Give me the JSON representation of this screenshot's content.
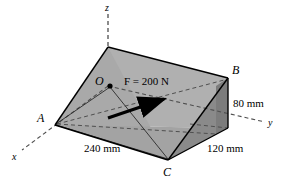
{
  "figure": {
    "type": "engineering-statics-diagram",
    "background_color": "#ffffff",
    "face_colors": {
      "top_light": "#b4b4b4",
      "left_front": "#a8a8a8",
      "front_right": "#9a9a9a",
      "end_dark": "#7d7d7d",
      "outline": "#000000",
      "dashed": "#555555"
    }
  },
  "axes": [
    {
      "name": "z",
      "label": "z",
      "label_x": 107,
      "label_y": 4
    },
    {
      "name": "y",
      "label": "y",
      "label_x": 268,
      "label_y": 120
    },
    {
      "name": "x",
      "label": "x",
      "label_x": 13,
      "label_y": 154
    }
  ],
  "points": [
    {
      "name": "O",
      "label": "O",
      "label_x": 95,
      "label_y": 77,
      "dot_x": 110,
      "dot_y": 86
    },
    {
      "name": "A",
      "label": "A",
      "label_x": 37,
      "label_y": 113
    },
    {
      "name": "B",
      "label": "B",
      "label_x": 232,
      "label_y": 66
    },
    {
      "name": "C",
      "label": "C",
      "label_x": 163,
      "label_y": 168
    }
  ],
  "force": {
    "label": "F = 200 N",
    "magnitude": "200",
    "unit": "N",
    "symbol": "F",
    "label_x": 124,
    "label_y": 77,
    "tail_x": 108,
    "tail_y": 118,
    "tip_x": 169,
    "tip_y": 98
  },
  "dimensions": [
    {
      "name": "base-length",
      "label": "240 mm",
      "label_x": 84,
      "label_y": 145
    },
    {
      "name": "height",
      "label": "80 mm",
      "label_x": 233,
      "label_y": 100
    },
    {
      "name": "depth",
      "label": "120 mm",
      "label_x": 208,
      "label_y": 145
    }
  ]
}
